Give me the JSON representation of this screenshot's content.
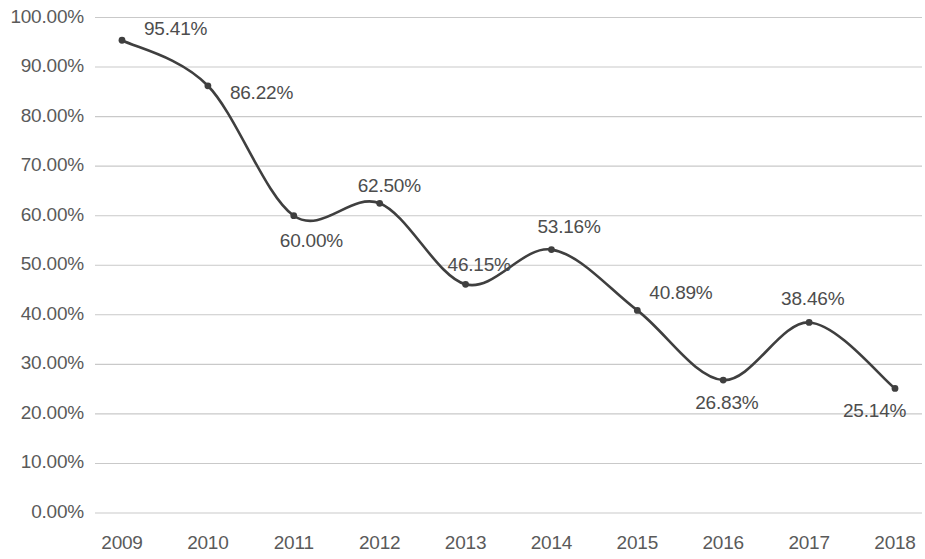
{
  "chart_data": {
    "type": "line",
    "title": "",
    "subtitle": "",
    "xlabel": "",
    "ylabel": "",
    "categories": [
      "2009",
      "2010",
      "2011",
      "2012",
      "2013",
      "2014",
      "2015",
      "2016",
      "2017",
      "2018"
    ],
    "values": [
      95.41,
      86.22,
      60.0,
      62.5,
      46.15,
      53.16,
      40.89,
      26.83,
      38.46,
      25.14
    ],
    "data_labels": [
      "95.41%",
      "86.22%",
      "60.00%",
      "62.50%",
      "46.15%",
      "53.16%",
      "40.89%",
      "26.83%",
      "38.46%",
      "25.14%"
    ],
    "ylim": [
      0,
      100
    ],
    "ytick_values": [
      0,
      10,
      20,
      30,
      40,
      50,
      60,
      70,
      80,
      90,
      100
    ],
    "ytick_labels": [
      "0.00%",
      "10.00%",
      "20.00%",
      "30.00%",
      "40.00%",
      "50.00%",
      "60.00%",
      "70.00%",
      "80.00%",
      "90.00%",
      "100.00%"
    ],
    "grid": "horizontal",
    "legend": "none",
    "smoothing": "smooth",
    "series": [
      {
        "name": "",
        "values": [
          95.41,
          86.22,
          60.0,
          62.5,
          46.15,
          53.16,
          40.89,
          26.83,
          38.46,
          25.14
        ]
      }
    ],
    "colors": {
      "line": "#3f3f3f",
      "marker": "#3f3f3f",
      "gridline": "#c9c9c9",
      "tick_text": "#5a5a5a",
      "label_text": "#4d4d4d",
      "background": "#ffffff"
    },
    "label_offsets": [
      {
        "dx": 22,
        "dy": -22
      },
      {
        "dx": 22,
        "dy": -4
      },
      {
        "dx": -14,
        "dy": 14
      },
      {
        "dx": -22,
        "dy": -28
      },
      {
        "dx": -18,
        "dy": -30
      },
      {
        "dx": -14,
        "dy": -34
      },
      {
        "dx": 12,
        "dy": -28
      },
      {
        "dx": -28,
        "dy": 12
      },
      {
        "dx": -28,
        "dy": -34
      },
      {
        "dx": -52,
        "dy": 12
      }
    ]
  }
}
